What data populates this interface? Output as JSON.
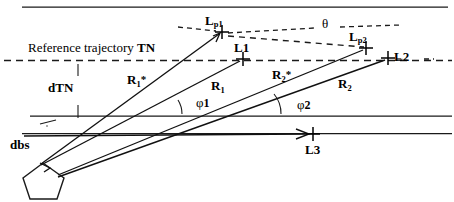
{
  "figure": {
    "title_text": "Reference trajectory TN",
    "title_prefix": "Reference trajectory ",
    "title_bold": "TN",
    "background_color": "#ffffff",
    "line_color": "#1a1a1a",
    "width": 454,
    "height": 202
  },
  "labels": {
    "lp1": "Lp1",
    "lp1_base": "L",
    "lp1_sub": "p1",
    "l1": "L1",
    "lp2": "Lp2",
    "lp2_base": "L",
    "lp2_sub": "p2",
    "l2": "L2",
    "l3": "L3",
    "theta": "θ",
    "dtn": "dTN",
    "dbs": "dbs",
    "r1_star": "R1*",
    "r1_star_base": "R",
    "r1_star_sub": "1",
    "r1_star_mark": "*",
    "r1": "R1",
    "r1_base": "R",
    "r1_sub": "1",
    "r2_star": "R2*",
    "r2_star_base": "R",
    "r2_star_sub": "2",
    "r2_star_mark": "*",
    "r2": "R2",
    "r2_base": "R",
    "r2_sub": "2",
    "phi1": "φ1",
    "phi1_base": "φ",
    "phi1_sub": "1",
    "phi2": "φ2",
    "phi2_base": "φ",
    "phi2_sub": "2"
  },
  "markers": [
    {
      "name": "Lp1",
      "x": 222,
      "y": 32
    },
    {
      "name": "L1",
      "x": 243,
      "y": 59
    },
    {
      "name": "Lp2",
      "x": 366,
      "y": 48
    },
    {
      "name": "L2",
      "x": 388,
      "y": 58
    },
    {
      "name": "L3",
      "x": 313,
      "y": 134
    }
  ],
  "geometry": {
    "top_solid_line": {
      "x1": 22,
      "y1": 7,
      "x2": 448,
      "y2": 7
    },
    "reference_dashed_line": {
      "x1": 6,
      "y1": 60,
      "x2": 452,
      "y2": 60
    },
    "mid_solid_line": {
      "x1": 30,
      "y1": 116,
      "x2": 452,
      "y2": 116
    },
    "lower_solid_line": {
      "x1": 22,
      "y1": 133,
      "x2": 452,
      "y2": 133
    },
    "sensor_origin": {
      "x": 40,
      "y": 164
    },
    "dtn_tick_x": 78
  }
}
